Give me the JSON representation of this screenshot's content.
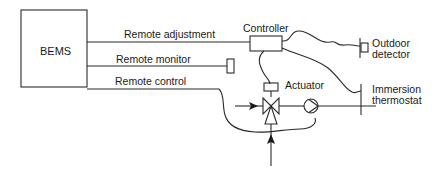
{
  "diagram": {
    "title": "",
    "nodes": {
      "bems": "BEMS",
      "controller": "Controller",
      "outdoor_detector": [
        "Outdoor",
        "detector"
      ],
      "actuator": "Actuator",
      "immersion_thermostat": [
        "Immersion",
        "thermostat"
      ]
    },
    "links": {
      "remote_adjustment": "Remote adjustment",
      "remote_monitor": "Remote monitor",
      "remote_control": "Remote control"
    },
    "colors": {
      "line": "#2a2a2a",
      "text": "#1a1a1a",
      "background": "#ffffff"
    }
  }
}
